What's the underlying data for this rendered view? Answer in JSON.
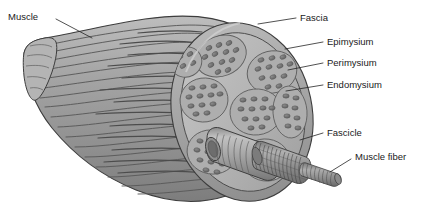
{
  "figure": {
    "background_color": "#ffffff",
    "ink_color": "#1a1a1a",
    "palette": {
      "muscle_belly": "#9b9b9b",
      "muscle_belly_light": "#b2b2b2",
      "muscle_belly_dark": "#7e7e7e",
      "cut_face": "#b6b6b6",
      "fascicle_dot": "#6f6f6f",
      "perimysium_band": "#9a9a9a",
      "epimysium_rim": "#a8a8a8",
      "fascicle_tube": "#9d9d9d",
      "fiber": "#8e8e8e",
      "outline": "#3a3a3a"
    }
  },
  "labels": [
    {
      "id": "muscle",
      "text": "Muscle",
      "text_x": 8,
      "text_y": 17,
      "anchor": "start",
      "leader": "M 56 19 L 92 38"
    },
    {
      "id": "fascia",
      "text": "Fascia",
      "text_x": 300,
      "text_y": 18,
      "anchor": "start",
      "leader": "M 296 18 L 258 24"
    },
    {
      "id": "epimysium",
      "text": "Epimysium",
      "text_x": 327,
      "text_y": 42,
      "anchor": "start",
      "leader": "M 323 42 L 285 49"
    },
    {
      "id": "perimysium",
      "text": "Perimysium",
      "text_x": 327,
      "text_y": 63,
      "anchor": "start",
      "leader": "M 323 63 L 288 70"
    },
    {
      "id": "endomysium",
      "text": "Endomysium",
      "text_x": 327,
      "text_y": 85,
      "anchor": "start",
      "leader": "M 323 85 L 286 91"
    },
    {
      "id": "fascicle",
      "text": "Fascicle",
      "text_x": 327,
      "text_y": 133,
      "anchor": "start",
      "leader": "M 323 133 L 300 140"
    },
    {
      "id": "muscle-fiber",
      "text": "Muscle fiber",
      "text_x": 355,
      "text_y": 157,
      "anchor": "start",
      "leader": "M 351 159 L 330 172"
    }
  ],
  "structures": [
    {
      "id": "muscle-belly",
      "name": "Muscle belly"
    },
    {
      "id": "tendon-end",
      "name": "Tendon end"
    },
    {
      "id": "cross-section-face",
      "name": "Cut cross-section face"
    },
    {
      "id": "epimysium-rim",
      "name": "Epimysium sheath rim"
    },
    {
      "id": "fascicle-bundles",
      "name": "Fascicle bundles in cross section"
    },
    {
      "id": "fascicle-tube",
      "name": "Protruding fascicle cylinder"
    },
    {
      "id": "fiber-bundle",
      "name": "Striated muscle fiber bundle"
    },
    {
      "id": "muscle-fiber-strand",
      "name": "Single muscle fiber strand"
    }
  ]
}
